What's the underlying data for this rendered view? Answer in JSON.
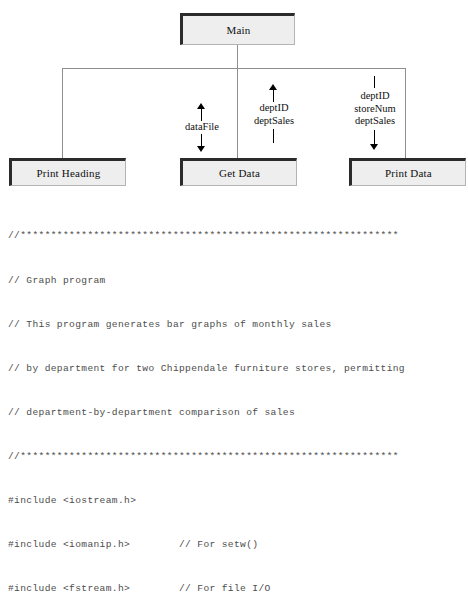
{
  "chart": {
    "root": {
      "label": "Main"
    },
    "modules": [
      {
        "label": "Print Heading"
      },
      {
        "label": "Get Data"
      },
      {
        "label": "Print Data"
      }
    ],
    "couples": [
      {
        "id": "datafile",
        "names": [
          "dataFile"
        ],
        "above": "up-arrow",
        "below": "down-arrow"
      },
      {
        "id": "getdata-return",
        "names": [
          "deptID",
          "deptSales"
        ],
        "above": "up-arrow",
        "below": "plain-line"
      },
      {
        "id": "printdata-in",
        "names": [
          "deptID",
          "storeNum",
          "deptSales"
        ],
        "above": "plain-line",
        "below": "down-arrow"
      }
    ],
    "colors": {
      "box_fill": "#eeeeee",
      "box_border_dark": "#2b2b2b",
      "box_border_light": "#b4b4b4",
      "connector": "#8e8e8e",
      "arrow": "#000000"
    }
  },
  "code": {
    "language": "cpp",
    "color": "#4d4d4d",
    "lines": [
      "//**************************************************************",
      "// Graph program",
      "// This program generates bar graphs of monthly sales",
      "// by department for two Chippendale furniture stores, permitting",
      "// department-by-department comparison of sales",
      "//**************************************************************",
      "#include <iostream.h>",
      "#include <iomanip.h>        // For setw()",
      "#include <fstream.h>        // For file I/O"
    ]
  }
}
